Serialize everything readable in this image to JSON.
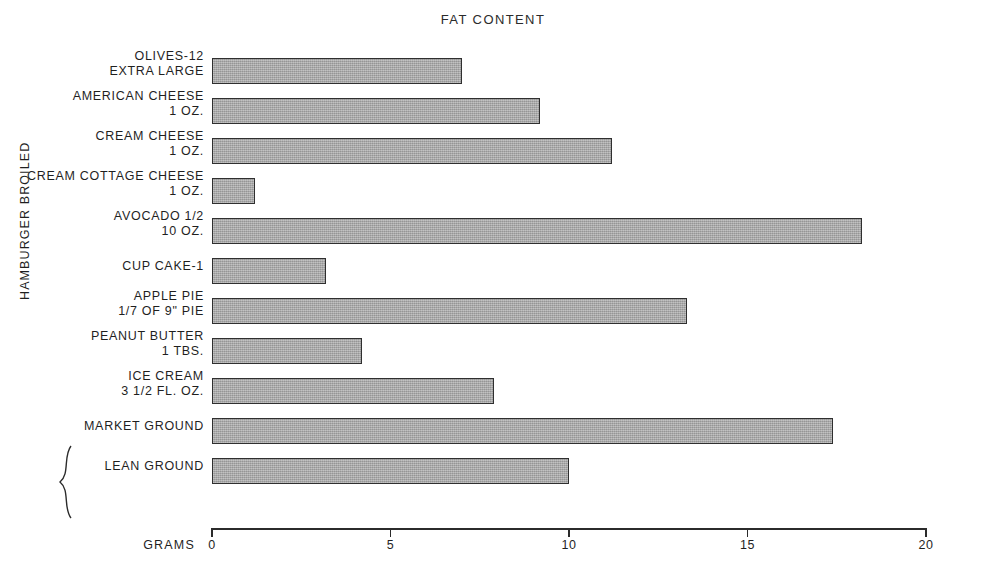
{
  "chart": {
    "title": "FAT CONTENT",
    "x_axis_caption": "GRAMS",
    "group_label": "HAMBURGER BROILED"
  },
  "chart_data": {
    "type": "bar",
    "orientation": "horizontal",
    "title": "FAT CONTENT",
    "xlabel": "GRAMS",
    "ylabel": "",
    "xlim": [
      0,
      20
    ],
    "xticks": [
      0,
      5,
      10,
      15,
      20
    ],
    "xtick_labels": [
      "0",
      "5",
      "10",
      "15",
      "20"
    ],
    "grid": false,
    "legend": false,
    "categories": [
      "OLIVES-12 EXTRA LARGE",
      "AMERICAN CHEESE 1 OZ.",
      "CREAM CHEESE 1 OZ.",
      "CREAM COTTAGE CHEESE 1 OZ.",
      "AVOCADO 1/2 10 OZ.",
      "CUP CAKE-1",
      "APPLE PIE 1/7 OF 9\" PIE",
      "PEANUT BUTTER 1 TBS.",
      "ICE CREAM 3 1/2 FL. OZ.",
      "MARKET GROUND",
      "LEAN GROUND"
    ],
    "values": [
      7.0,
      9.2,
      11.2,
      1.2,
      18.2,
      3.2,
      13.3,
      4.2,
      7.9,
      17.4,
      10.0
    ],
    "bars": [
      {
        "line1": "OLIVES-12",
        "line2": "EXTRA LARGE",
        "value": 7.0
      },
      {
        "line1": "AMERICAN CHEESE",
        "line2": "1 OZ.",
        "value": 9.2
      },
      {
        "line1": "CREAM CHEESE",
        "line2": "1 OZ.",
        "value": 11.2
      },
      {
        "line1": "CREAM COTTAGE CHEESE",
        "line2": "1 OZ.",
        "value": 1.2
      },
      {
        "line1": "AVOCADO 1/2",
        "line2": "10 OZ.",
        "value": 18.2
      },
      {
        "line1": "CUP CAKE-1",
        "line2": "",
        "value": 3.2
      },
      {
        "line1": "APPLE PIE",
        "line2": "1/7 OF 9\" PIE",
        "value": 13.3
      },
      {
        "line1": "PEANUT BUTTER",
        "line2": "1 TBS.",
        "value": 4.2
      },
      {
        "line1": "ICE CREAM",
        "line2": "3 1/2 FL. OZ.",
        "value": 7.9
      },
      {
        "line1": "MARKET GROUND",
        "line2": "",
        "value": 17.4
      },
      {
        "line1": "LEAN GROUND",
        "line2": "",
        "value": 10.0
      }
    ],
    "annotations": [
      {
        "text": "HAMBURGER BROILED",
        "applies_to": [
          "MARKET GROUND",
          "LEAN GROUND"
        ],
        "style": "rotated-brace"
      }
    ],
    "colors": {
      "bar_fill": "#a9a9a9",
      "bar_stroke": "#2f2f2f",
      "axis": "#2b2b2b",
      "text": "#1f1f1f",
      "background": "#ffffff"
    }
  }
}
